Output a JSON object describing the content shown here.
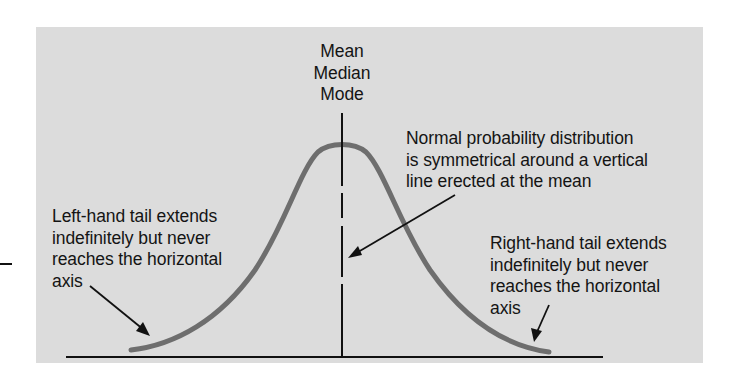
{
  "diagram": {
    "title": "Normal probability distribution",
    "center_labels": [
      "Mean",
      "Median",
      "Mode"
    ],
    "annotations": {
      "symmetry": [
        "Normal probability distribution",
        "is symmetrical around a vertical",
        "line erected at the mean"
      ],
      "left_tail": [
        "Left-hand tail extends",
        "indefinitely but never",
        "reaches the horizontal",
        "axis"
      ],
      "right_tail": [
        "Right-hand tail extends",
        "indefinitely but never",
        "reaches the horizontal",
        "axis"
      ]
    },
    "colors": {
      "panel": "#dcdcdc",
      "curve": "#6e6e6e",
      "lines": "#111111",
      "text": "#141414"
    }
  }
}
